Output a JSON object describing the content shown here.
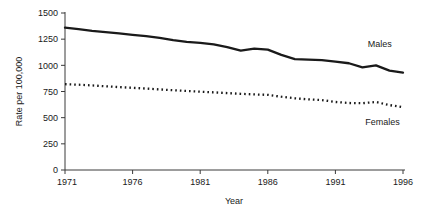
{
  "chart_data": {
    "type": "line",
    "title": "",
    "xlabel": "Year",
    "ylabel": "Rate per 100,000",
    "xlim": [
      1971,
      1996
    ],
    "ylim": [
      0,
      1500
    ],
    "grid": false,
    "legend_position": "inline-right",
    "xticks": [
      "1971",
      "1976",
      "1981",
      "1986",
      "1991",
      "1996"
    ],
    "xtick_values": [
      1971,
      1976,
      1981,
      1986,
      1991,
      1996
    ],
    "yticks": [
      "0",
      "250",
      "500",
      "750",
      "1000",
      "1250",
      "1500"
    ],
    "ytick_values": [
      0,
      250,
      500,
      750,
      1000,
      1250,
      1500
    ],
    "x": [
      1971,
      1972,
      1973,
      1974,
      1975,
      1976,
      1977,
      1978,
      1979,
      1980,
      1981,
      1982,
      1983,
      1984,
      1985,
      1986,
      1987,
      1988,
      1989,
      1990,
      1991,
      1992,
      1993,
      1994,
      1995,
      1996
    ],
    "series": [
      {
        "name": "Males",
        "style": "solid",
        "color": "#1a1a1a",
        "values": [
          1360,
          1345,
          1330,
          1318,
          1305,
          1292,
          1280,
          1262,
          1240,
          1225,
          1215,
          1200,
          1175,
          1140,
          1160,
          1150,
          1100,
          1060,
          1055,
          1050,
          1035,
          1020,
          980,
          1000,
          950,
          930
        ]
      },
      {
        "name": "Females",
        "style": "dotted",
        "color": "#1a1a1a",
        "values": [
          820,
          815,
          808,
          800,
          792,
          785,
          778,
          770,
          762,
          755,
          748,
          742,
          735,
          728,
          722,
          718,
          700,
          685,
          675,
          668,
          650,
          640,
          638,
          650,
          620,
          600
        ]
      }
    ],
    "annotations": [
      {
        "text": "Males",
        "x": 1993.4,
        "y": 1175
      },
      {
        "text": "Females",
        "x": 1993.2,
        "y": 430
      }
    ]
  }
}
